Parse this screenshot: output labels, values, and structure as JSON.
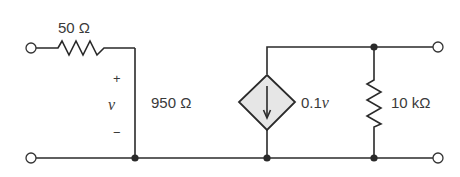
{
  "diagram": {
    "type": "circuit",
    "components": {
      "r_series": {
        "label": "50 Ω"
      },
      "r_shunt": {
        "label": "950 Ω"
      },
      "dependent_source": {
        "label_coeff": "0.1",
        "label_var": "v",
        "kind": "voltage-controlled current source",
        "direction": "down"
      },
      "r_load": {
        "label": "10 kΩ"
      }
    },
    "voltage_marker": {
      "plus": "+",
      "var": "v",
      "minus": "−"
    },
    "terminals": [
      "input-top",
      "input-bottom",
      "output-top",
      "output-bottom"
    ],
    "colors": {
      "wire": "#2a2a2a",
      "source_fill": "#e6e6e6",
      "text": "#3a3a3a"
    }
  }
}
